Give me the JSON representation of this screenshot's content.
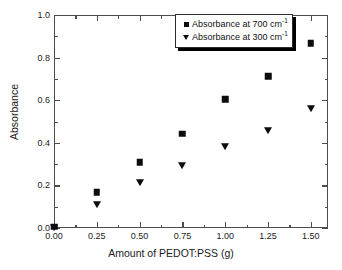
{
  "chart_data": {
    "type": "scatter",
    "title": "",
    "xlabel": "Amount of PEDOT:PSS (g)",
    "ylabel": "Absorbance",
    "xlim": [
      0.0,
      1.6
    ],
    "ylim": [
      0.0,
      1.0
    ],
    "xticks": [
      0.0,
      0.25,
      0.5,
      0.75,
      1.0,
      1.25,
      1.5
    ],
    "xtick_labels": [
      "0.00",
      "0.25",
      "0.50",
      "0.75",
      "1.00",
      "1.25",
      "1.50"
    ],
    "yticks": [
      0.0,
      0.2,
      0.4,
      0.6,
      0.8,
      1.0
    ],
    "ytick_labels": [
      "0.0",
      "0.2",
      "0.4",
      "0.6",
      "0.8",
      "1.0"
    ],
    "grid": false,
    "legend_position": "top-right",
    "marker_color": "#0d0d0d",
    "axis_color": "#4d4d4d",
    "x": [
      0.0,
      0.25,
      0.5,
      0.75,
      1.0,
      1.25,
      1.5
    ],
    "series": [
      {
        "name": "Absorbance at 700 cm",
        "name_sup": "-1",
        "marker": "square",
        "values": [
          0.005,
          0.168,
          0.308,
          0.442,
          0.605,
          0.713,
          0.868
        ]
      },
      {
        "name": "Absorbance at 300 cm",
        "name_sup": "-1",
        "marker": "triangle-down",
        "values": [
          0.005,
          0.113,
          0.215,
          0.298,
          0.387,
          0.46,
          0.562
        ]
      }
    ]
  },
  "legend": {
    "entries": [
      {
        "label": "Absorbance at 700 cm",
        "sup": "-1",
        "marker": "square"
      },
      {
        "label": "Absorbance at 300 cm",
        "sup": "-1",
        "marker": "triangle-down"
      }
    ]
  }
}
